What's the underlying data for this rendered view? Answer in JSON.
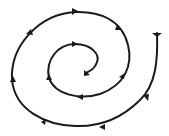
{
  "diagram": {
    "type": "spiral-with-direction-arrows",
    "stroke_color": "#1a1a1a",
    "background": "#ffffff",
    "direction": "inward",
    "arrow_count": 12
  }
}
